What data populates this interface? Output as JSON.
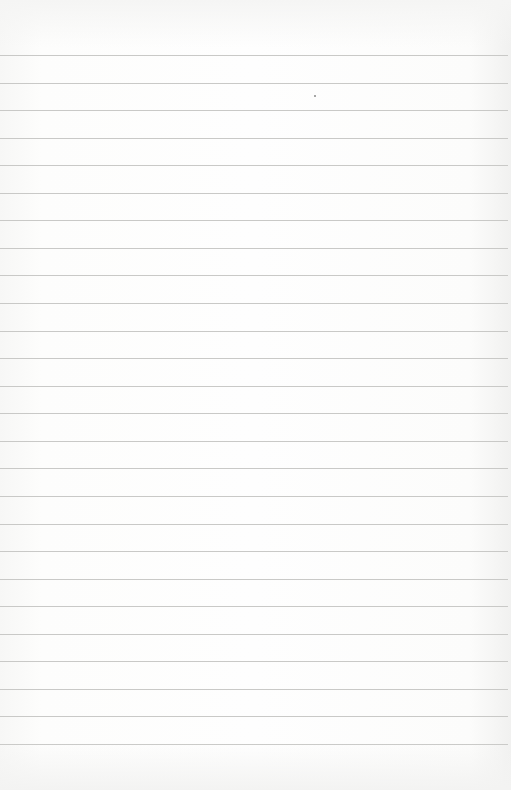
{
  "page": {
    "type": "lined-paper",
    "background_color": "#fbfbfa",
    "rule_color": "#c9c9c7",
    "rule_count": 26,
    "first_rule_y": 55,
    "rule_spacing": 27.56
  }
}
